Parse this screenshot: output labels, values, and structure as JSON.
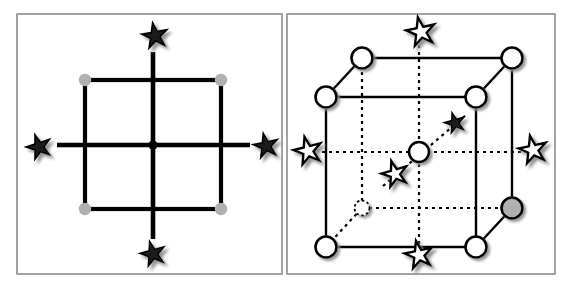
{
  "figure": {
    "type": "diagram",
    "background_color": "#ffffff",
    "width": 571,
    "height": 287,
    "panel_border_color": "#8c8c8c",
    "line_color": "#000000",
    "node_grey_fill": "#b0b0b0",
    "node_white_fill": "#ffffff",
    "star_dark_fill": "#1a1a1a",
    "star_white_fill": "#ffffff",
    "shadow_color": "#9a9a9a"
  },
  "panels": [
    {
      "id": "left-panel",
      "name": "square-lattice-panel",
      "label": "",
      "frame": {
        "x": 17,
        "y": 14,
        "w": 265,
        "h": 260
      },
      "description": "Two-dimensional square net with four-fold axis at centre",
      "square": {
        "x": 85,
        "y": 80,
        "w": 136,
        "h": 129
      },
      "center_dot": {
        "cx": 153,
        "cy": 145,
        "r": 4.6,
        "fill": "#000000"
      },
      "corner_nodes": [
        {
          "name": "corner-node-top-left",
          "cx": 85,
          "cy": 80,
          "r": 6.2,
          "fill": "#b0b0b0"
        },
        {
          "name": "corner-node-top-right",
          "cx": 221,
          "cy": 80,
          "r": 6.2,
          "fill": "#b0b0b0"
        },
        {
          "name": "corner-node-bottom-left",
          "cx": 85,
          "cy": 209,
          "r": 6.2,
          "fill": "#b0b0b0"
        },
        {
          "name": "corner-node-bottom-right",
          "cx": 221,
          "cy": 209,
          "r": 6.2,
          "fill": "#b0b0b0"
        }
      ],
      "axes": [
        {
          "name": "axis-vertical",
          "x1": 153,
          "y1": 52,
          "x2": 153,
          "y2": 239
        },
        {
          "name": "axis-horizontal",
          "x1": 57,
          "y1": 145,
          "x2": 250,
          "y2": 145
        }
      ],
      "stars": [
        {
          "name": "rotation-axis-star-top",
          "cx": 155,
          "cy": 36,
          "size": 27,
          "rotation": -10,
          "style": "dark"
        },
        {
          "name": "rotation-axis-star-bottom",
          "cx": 153,
          "cy": 254,
          "size": 26,
          "rotation": -15,
          "style": "dark"
        },
        {
          "name": "rotation-axis-star-left",
          "cx": 39,
          "cy": 147,
          "size": 26,
          "rotation": -18,
          "style": "dark"
        },
        {
          "name": "rotation-axis-star-right",
          "cx": 266,
          "cy": 146,
          "size": 26,
          "rotation": -12,
          "style": "dark"
        }
      ]
    },
    {
      "id": "right-panel",
      "name": "cubic-cell-panel",
      "label": "",
      "frame": {
        "x": 287,
        "y": 14,
        "w": 268,
        "h": 260
      },
      "description": "Three-dimensional cubic unit cell with lattice nodes and four-fold axes",
      "cube": {
        "front_face": {
          "x": 326,
          "y": 97,
          "w": 150,
          "h": 150
        },
        "back_face": {
          "x": 362,
          "y": 58,
          "w": 150,
          "h": 150
        },
        "depth_dx": 36,
        "depth_dy": -39
      },
      "nodes": [
        {
          "name": "node-front-top-left",
          "cx": 326,
          "cy": 97,
          "r": 10.5,
          "fill": "#ffffff",
          "edge": "solid"
        },
        {
          "name": "node-front-top-right",
          "cx": 476,
          "cy": 97,
          "r": 10.5,
          "fill": "#ffffff",
          "edge": "solid"
        },
        {
          "name": "node-front-bottom-left",
          "cx": 326,
          "cy": 247,
          "r": 10.5,
          "fill": "#ffffff",
          "edge": "solid"
        },
        {
          "name": "node-front-bottom-right",
          "cx": 476,
          "cy": 247,
          "r": 10.5,
          "fill": "#ffffff",
          "edge": "solid"
        },
        {
          "name": "node-back-top-left",
          "cx": 362,
          "cy": 58,
          "r": 10.5,
          "fill": "#ffffff",
          "edge": "solid"
        },
        {
          "name": "node-back-top-right",
          "cx": 512,
          "cy": 58,
          "r": 10.5,
          "fill": "#ffffff",
          "edge": "solid"
        },
        {
          "name": "node-back-bottom-left",
          "cx": 362,
          "cy": 208,
          "r": 7.5,
          "fill": "#ffffff",
          "edge": "dotted"
        },
        {
          "name": "node-back-bottom-right",
          "cx": 512,
          "cy": 208,
          "r": 10.5,
          "fill": "#b0b0b0",
          "edge": "solid"
        },
        {
          "name": "node-body-centre",
          "cx": 419,
          "cy": 152,
          "r": 10.0,
          "fill": "#ffffff",
          "edge": "solid"
        }
      ],
      "stars": [
        {
          "name": "rotation-axis-star-top",
          "cx": 421,
          "cy": 32,
          "size": 30,
          "rotation": -12,
          "style": "white"
        },
        {
          "name": "rotation-axis-star-bottom",
          "cx": 419,
          "cy": 255,
          "size": 29,
          "rotation": -12,
          "style": "white"
        },
        {
          "name": "rotation-axis-star-left",
          "cx": 308,
          "cy": 151,
          "size": 29,
          "rotation": -14,
          "style": "white"
        },
        {
          "name": "rotation-axis-star-right",
          "cx": 533,
          "cy": 150,
          "size": 29,
          "rotation": -12,
          "style": "white"
        },
        {
          "name": "rotation-axis-star-body-front",
          "cx": 395,
          "cy": 174,
          "size": 27,
          "rotation": -16,
          "style": "white"
        },
        {
          "name": "rotation-axis-star-body-back",
          "cx": 455,
          "cy": 123,
          "size": 21,
          "rotation": -16,
          "style": "dark"
        }
      ],
      "axes": [
        {
          "name": "axis-vertical-through-cell",
          "style": "dotted",
          "x1": 419,
          "y1": 45,
          "x2": 419,
          "y2": 247
        },
        {
          "name": "axis-horizontal-through-cell",
          "style": "dotted",
          "x1": 322,
          "y1": 152,
          "x2": 521,
          "y2": 152
        },
        {
          "name": "axis-diagonal-body",
          "style": "dotted",
          "x1": 383,
          "y1": 186,
          "x2": 466,
          "y2": 115
        }
      ]
    }
  ]
}
